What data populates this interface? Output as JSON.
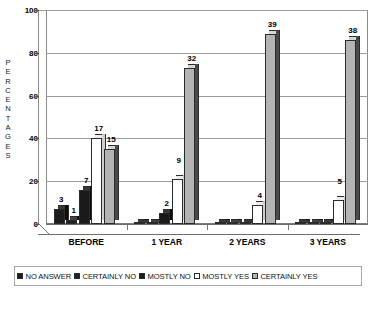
{
  "chart_data": {
    "type": "bar",
    "title": "",
    "xlabel": "",
    "ylabel": "PERCENTAGES",
    "ylim": [
      0,
      100
    ],
    "yticks": [
      0,
      20,
      40,
      60,
      80,
      100
    ],
    "grid": true,
    "legend_position": "bottom",
    "categories": [
      "BEFORE",
      "1 YEAR",
      "2 YEARS",
      "3 YEARS"
    ],
    "series": [
      {
        "name": "NO ANSWER",
        "color": "#1c1c1c",
        "values": [
          7,
          0,
          0,
          0
        ],
        "labels": [
          "3",
          "",
          "",
          ""
        ]
      },
      {
        "name": "CERTAINLY NO",
        "color": "#232323",
        "values": [
          2,
          0,
          0,
          0
        ],
        "labels": [
          "1",
          "",
          "",
          ""
        ]
      },
      {
        "name": "MOSTLY NO",
        "color": "#1a1a1a",
        "values": [
          16,
          5,
          0,
          0
        ],
        "labels": [
          "7",
          "2",
          "",
          ""
        ]
      },
      {
        "name": "MOSTLY YES",
        "color": "#ffffff",
        "values": [
          40,
          21,
          9,
          11
        ],
        "labels": [
          "17",
          "9",
          "4",
          "5"
        ]
      },
      {
        "name": "CERTAINLY YES",
        "color": "#b4b4b4",
        "values": [
          35,
          73,
          89,
          86
        ],
        "labels": [
          "15",
          "32",
          "39",
          "38"
        ]
      }
    ]
  },
  "axis": {
    "y_title_letters": [
      "P",
      "E",
      "R",
      "C",
      "E",
      "N",
      "T",
      "A",
      "G",
      "E",
      "S"
    ],
    "y_tick_labels": [
      "100",
      "80",
      "60",
      "40",
      "20",
      "0"
    ]
  },
  "legend": {
    "items": [
      {
        "label": "NO ANSWER"
      },
      {
        "label": "CERTAINLY NO"
      },
      {
        "label": "MOSTLY NO"
      },
      {
        "label": "MOSTLY YES"
      },
      {
        "label": "CERTAINLY YES"
      }
    ]
  }
}
